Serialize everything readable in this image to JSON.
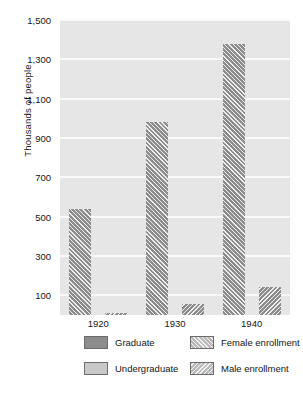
{
  "chart_data": {
    "type": "bar",
    "title": "",
    "xlabel": "",
    "ylabel": "Thousands of people",
    "categories": [
      "1920",
      "1930",
      "1940"
    ],
    "ylim": [
      0,
      1500
    ],
    "yticks": [
      100,
      300,
      500,
      700,
      900,
      1100,
      1300,
      1500
    ],
    "ytick_labels": [
      "100",
      "300",
      "500",
      "700",
      "900",
      "1,100",
      "1,300",
      "1,500"
    ],
    "grid": true,
    "legend_position": "below-axes",
    "series": [
      {
        "name": "Graduate",
        "pattern": "solid-dark",
        "color": "#8c8c8c",
        "values": [
          540,
          980,
          1380
        ]
      },
      {
        "name": "Undergraduate",
        "pattern": "solid-light",
        "color": "#c9c9c9",
        "values": [
          10,
          55,
          140
        ]
      }
    ],
    "legend": [
      {
        "label": "Graduate",
        "swatch": "solid-dark"
      },
      {
        "label": "Undergraduate",
        "swatch": "solid-light"
      },
      {
        "label": "Female enrollment",
        "swatch": "hatch-forward"
      },
      {
        "label": "Male enrollment",
        "swatch": "hatch-back"
      }
    ],
    "bars": [
      {
        "category": "1920",
        "series": "Graduate",
        "value": 540,
        "hatch": "female"
      },
      {
        "category": "1920",
        "series": "Undergraduate",
        "value": 10,
        "hatch": "male"
      },
      {
        "category": "1930",
        "series": "Graduate",
        "value": 980,
        "hatch": "female"
      },
      {
        "category": "1930",
        "series": "Undergraduate",
        "value": 55,
        "hatch": "male"
      },
      {
        "category": "1940",
        "series": "Graduate",
        "value": 1380,
        "hatch": "female"
      },
      {
        "category": "1940",
        "series": "Undergraduate",
        "value": 140,
        "hatch": "male"
      }
    ]
  },
  "axis": {
    "y_title": "Thousands of people",
    "y_labels": [
      "1,500",
      "1,300",
      "1,100",
      "900",
      "700",
      "500",
      "300",
      "100"
    ],
    "x_labels": [
      "1920",
      "1930",
      "1940"
    ]
  },
  "legend": {
    "items": [
      {
        "label": "Graduate"
      },
      {
        "label": "Undergraduate"
      },
      {
        "label": "Female enrollment"
      },
      {
        "label": "Male enrollment"
      }
    ]
  },
  "colors": {
    "graduate": "#8c8c8c",
    "undergraduate": "#c9c9c9",
    "plot_background": "#e6e6e6",
    "gridline": "#fafafa",
    "text": "#161616"
  }
}
